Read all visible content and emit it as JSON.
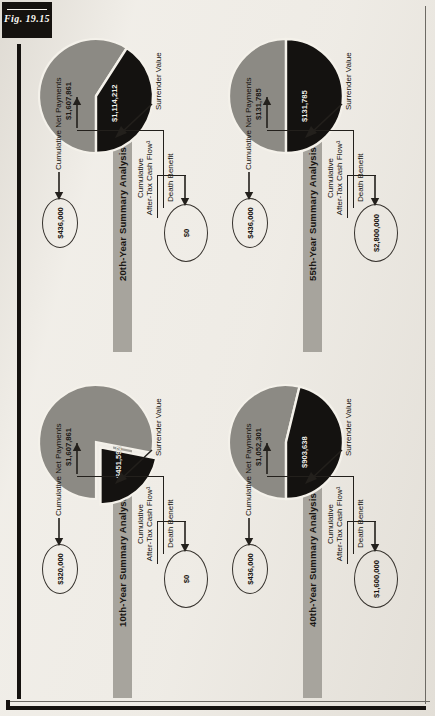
{
  "figure": {
    "tab_label": "Fig. 19.15",
    "colors": {
      "paper": "#efece6",
      "ink": "#15120f",
      "title_bar": "#a7a49d",
      "death_benefit_slice": "#8c8a84",
      "surrender_value_slice": "#141210"
    }
  },
  "labels": {
    "death_benefit": "Death Benefit",
    "surrender_value": "Surrender Value",
    "cumulative_net_payments": "Cumulative Net Payments",
    "cumulative_after_tax_line1": "Cumulative",
    "cumulative_after_tax_line2": "After-Tax Cash Flow¹"
  },
  "panels": [
    {
      "id": "tenth-year",
      "title": "10th-Year Summary Analysis",
      "death_benefit": "$1,607,861",
      "surrender_value": "$451,592",
      "cumulative_net_payments": "$320,000",
      "cumulative_after_tax_cash_flow": "$0",
      "exploded": true
    },
    {
      "id": "twentieth-year",
      "title": "20th-Year Summary Analysis",
      "death_benefit": "$1,607,861",
      "surrender_value": "$1,114,212",
      "cumulative_net_payments": "$436,000",
      "cumulative_after_tax_cash_flow": "$0",
      "exploded": false
    },
    {
      "id": "fortieth-year",
      "title": "40th-Year Summary Analysis",
      "death_benefit": "$1,052,301",
      "surrender_value": "$903,638",
      "cumulative_net_payments": "$436,000",
      "cumulative_after_tax_cash_flow": "$1,600,000",
      "exploded": false
    },
    {
      "id": "fiftyfifth-year",
      "title": "55th-Year Summary Analysis",
      "death_benefit": "$131,785",
      "surrender_value": "$131,785",
      "cumulative_net_payments": "$436,000",
      "cumulative_after_tax_cash_flow": "$2,800,000",
      "exploded": false
    }
  ],
  "chart_data": {
    "type": "pie",
    "charts": [
      {
        "title": "10th-Year Summary Analysis",
        "categories": [
          "Death Benefit",
          "Surrender Value"
        ],
        "values": [
          1607861,
          451592
        ],
        "labels": [
          "$1,607,861",
          "$451,592"
        ],
        "exploded_slice": "Surrender Value",
        "annotations": {
          "Cumulative Net Payments": 320000,
          "Cumulative After-Tax Cash Flow": 0
        }
      },
      {
        "title": "20th-Year Summary Analysis",
        "categories": [
          "Death Benefit",
          "Surrender Value"
        ],
        "values": [
          1607861,
          1114212
        ],
        "labels": [
          "$1,607,861",
          "$1,114,212"
        ],
        "exploded_slice": null,
        "annotations": {
          "Cumulative Net Payments": 436000,
          "Cumulative After-Tax Cash Flow": 0
        }
      },
      {
        "title": "40th-Year Summary Analysis",
        "categories": [
          "Death Benefit",
          "Surrender Value"
        ],
        "values": [
          1052301,
          903638
        ],
        "labels": [
          "$1,052,301",
          "$903,638"
        ],
        "exploded_slice": null,
        "annotations": {
          "Cumulative Net Payments": 436000,
          "Cumulative After-Tax Cash Flow": 1600000
        }
      },
      {
        "title": "55th-Year Summary Analysis",
        "categories": [
          "Death Benefit",
          "Surrender Value"
        ],
        "values": [
          131785,
          131785
        ],
        "labels": [
          "$131,785",
          "$131,785"
        ],
        "exploded_slice": null,
        "annotations": {
          "Cumulative Net Payments": 436000,
          "Cumulative After-Tax Cash Flow": 2800000
        }
      }
    ],
    "legend": [
      "Death Benefit",
      "Surrender Value"
    ],
    "grid": false,
    "legend_position": "callout-leaders"
  }
}
